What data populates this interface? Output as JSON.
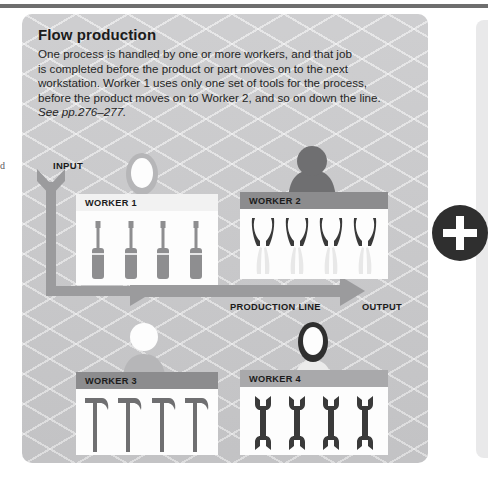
{
  "page": {
    "margin_note": "d",
    "accent_dark": "#2f2f2f",
    "panel_bg": "#c9c9cb"
  },
  "panel": {
    "title": "Flow production",
    "body_lines": [
      "One process is handled by one or more workers, and that job",
      "is completed before the product or part moves on to the next",
      "workstation. Worker 1 uses only one set of tools for the process,",
      "before the product moves on to Worker 2, and so on down the line."
    ],
    "reference": "See pp.276–277.",
    "input_label": "INPUT",
    "production_line_label": "PRODUCTION LINE",
    "output_label": "OUTPUT"
  },
  "stations": [
    {
      "label": "WORKER 1",
      "tool": "screwdriver-icon",
      "tool_count": 4,
      "bar_style": "bar-light",
      "figure_style": "pale",
      "tool_color": "#8e8e90"
    },
    {
      "label": "WORKER 2",
      "tool": "pliers-icon",
      "tool_count": 4,
      "bar_style": "bar-dark",
      "figure_style": "mid",
      "tool_color": "#3a3a3a"
    },
    {
      "label": "WORKER 3",
      "tool": "hammer-icon",
      "tool_count": 4,
      "bar_style": "bar-dark",
      "figure_style": "light-white-head",
      "tool_color": "#6f6f71"
    },
    {
      "label": "WORKER 4",
      "tool": "wrench-icon",
      "tool_count": 4,
      "bar_style": "bar-mid",
      "figure_style": "dark-hair",
      "tool_color": "#3a3a3a"
    }
  ],
  "badge": {
    "icon": "plus-icon"
  }
}
